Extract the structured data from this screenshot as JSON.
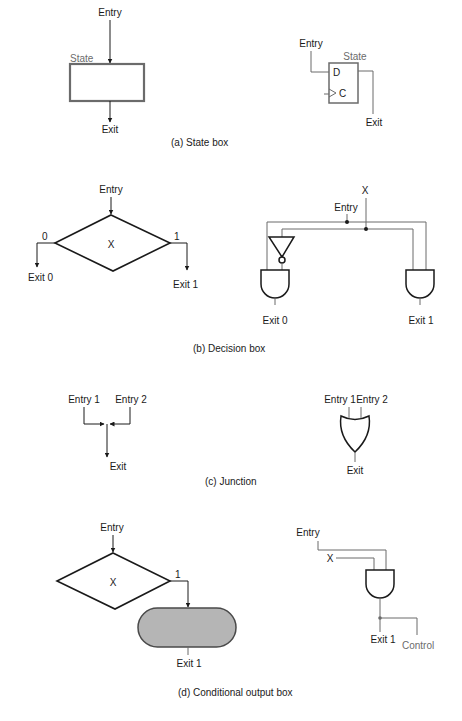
{
  "figure": {
    "sections": [
      {
        "id": "a",
        "caption": "(a) State box",
        "asm": {
          "entry": "Entry",
          "state_label": "State",
          "exit": "Exit"
        },
        "circuit": {
          "entry": "Entry",
          "state_label": "State",
          "d_pin": "D",
          "c_pin": "C",
          "exit": "Exit"
        }
      },
      {
        "id": "b",
        "caption": "(b) Decision box",
        "asm": {
          "entry": "Entry",
          "condition": "X",
          "branch0": "0",
          "branch1": "1",
          "exit0": "Exit 0",
          "exit1": "Exit 1"
        },
        "circuit": {
          "x": "X",
          "entry": "Entry",
          "exit0": "Exit 0",
          "exit1": "Exit 1"
        }
      },
      {
        "id": "c",
        "caption": "(c) Junction",
        "asm": {
          "entry1": "Entry 1",
          "entry2": "Entry 2",
          "exit": "Exit"
        },
        "circuit": {
          "entry1": "Entry 1",
          "entry2": "Entry 2",
          "exit": "Exit"
        }
      },
      {
        "id": "d",
        "caption": "(d) Conditional output box",
        "asm": {
          "entry": "Entry",
          "condition": "X",
          "branch1": "1",
          "exit1": "Exit 1"
        },
        "circuit": {
          "entry": "Entry",
          "x": "X",
          "exit1": "Exit 1",
          "control": "Control"
        }
      }
    ],
    "colors": {
      "line": "#1a1a1a",
      "gray": "#6b6b6b",
      "fill_output_box": "#b5b5b5"
    }
  }
}
